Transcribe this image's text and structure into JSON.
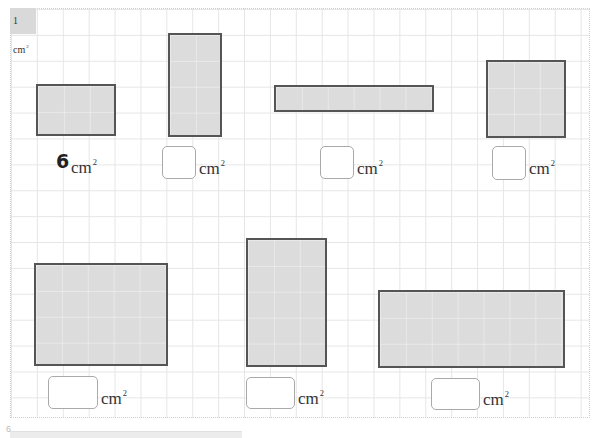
{
  "unit": {
    "value": "1",
    "unit": "cm",
    "exp": "2"
  },
  "grid": {
    "cell_cm": 1,
    "cols": 22,
    "rows": 16
  },
  "colors": {
    "shape_fill": "#dcdcdc",
    "shape_border": "#555555",
    "grid_line": "#e6e6e6",
    "unit_cell": "#d9d9d9"
  },
  "problems": [
    {
      "id": "a",
      "width_cells": 3,
      "height_cells": 2,
      "answer": "6",
      "given": true,
      "unit": "cm",
      "exp": "2"
    },
    {
      "id": "b",
      "width_cells": 2,
      "height_cells": 4,
      "answer": "",
      "given": false,
      "unit": "cm",
      "exp": "2"
    },
    {
      "id": "c",
      "width_cells": 6,
      "height_cells": 1,
      "answer": "",
      "given": false,
      "unit": "cm",
      "exp": "2"
    },
    {
      "id": "d",
      "width_cells": 3,
      "height_cells": 3,
      "answer": "",
      "given": false,
      "unit": "cm",
      "exp": "2"
    },
    {
      "id": "e",
      "width_cells": 5,
      "height_cells": 4,
      "answer": "",
      "given": false,
      "unit": "cm",
      "exp": "2"
    },
    {
      "id": "f",
      "width_cells": 3,
      "height_cells": 5,
      "answer": "",
      "given": false,
      "unit": "cm",
      "exp": "2"
    },
    {
      "id": "g",
      "width_cells": 7,
      "height_cells": 3,
      "answer": "",
      "given": false,
      "unit": "cm",
      "exp": "2"
    }
  ],
  "footer": {
    "glyph": "6"
  }
}
